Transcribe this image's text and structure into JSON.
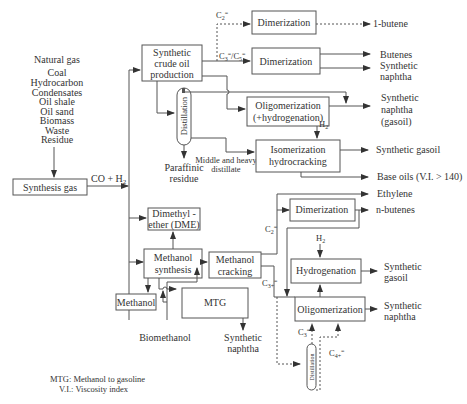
{
  "feedstocks": [
    "Natural gas",
    "Coal",
    "Hydrocarbon",
    "Condensates",
    "Oil shale",
    "Oil sand",
    "Biomass",
    "Waste",
    "Residue"
  ],
  "boxes": {
    "synthesis_gas": "Synthesis gas",
    "synthetic_crude_1": "Synthetic",
    "synthetic_crude_2": "crude oil",
    "synthetic_crude_3": "production",
    "dimerization_top": "Dimerization",
    "dimerization_mid": "Dimerization",
    "oligomerization_hyd_1": "Oligomerization",
    "oligomerization_hyd_2": "(+hydrogenation)",
    "isomerization_1": "Isomerization",
    "isomerization_2": "hydrocracking",
    "dme_1": "Dimethyl -",
    "dme_2": "ether (DME)",
    "methanol_synthesis_1": "Methanol",
    "methanol_synthesis_2": "synthesis",
    "methanol_cracking_1": "Methanol",
    "methanol_cracking_2": "cracking",
    "methanol": "Methanol",
    "mtg": "MTG",
    "dimerization_low": "Dimerization",
    "hydrogenation": "Hydrogenation",
    "oligomerization": "Oligomerization",
    "distillation": "Distillation",
    "distillation_small": "Distillation"
  },
  "labels": {
    "co_h2": "CO + H",
    "co_h2_sub": "2",
    "c2": "C",
    "c3c5": "C",
    "h2": "H",
    "h2_sub": "2",
    "paraffinic_1": "Paraffinic",
    "paraffinic_2": "residue",
    "middle_1": "Middle and heavy",
    "middle_2": "distillate",
    "biomethanol": "Biomethanol",
    "c3plus": "C",
    "c4plus": "C"
  },
  "products": {
    "butene1": "1-butene",
    "butenes": "Butenes",
    "syn_naphtha_a1": "Synthetic",
    "syn_naphtha_a2": "naphtha",
    "syn_naphtha_gasoil_1": "Synthetic",
    "syn_naphtha_gasoil_2": "naphtha",
    "syn_naphtha_gasoil_3": "(gasoil)",
    "syn_gasoil": "Synthetic gasoil",
    "base_oils": "Base oils (V.I. > 140)",
    "ethylene": "Ethylene",
    "n_butenes": "n-butenes",
    "syn_gasoil_b1": "Synthetic",
    "syn_gasoil_b2": "gasoil",
    "syn_naphtha_b1": "Synthetic",
    "syn_naphtha_b2": "naphtha",
    "mtg_naphtha_1": "Synthetic",
    "mtg_naphtha_2": "naphtha"
  },
  "legend": {
    "mtg": "MTG: Methanol to gasoline",
    "vi": "V.I.: Viscosity index"
  }
}
